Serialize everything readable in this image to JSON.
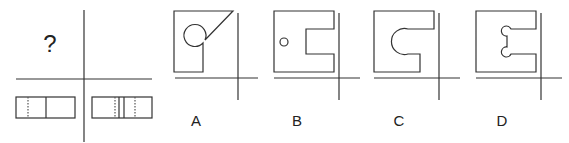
{
  "question": {
    "placeholder_symbol": "?",
    "description": "Three-view drawing; top view unknown. Front view and side view are rectangles with hidden (dashed) and visible lines."
  },
  "views": {
    "front_view": {
      "lines": [
        "dashed",
        "solid"
      ]
    },
    "side_view": {
      "lines": [
        "dashed",
        "solid",
        "solid",
        "dashed"
      ]
    }
  },
  "options": [
    {
      "label": "A",
      "shape": "square with diagonal cut and circular notch"
    },
    {
      "label": "B",
      "shape": "square with rectangular notch and small hole"
    },
    {
      "label": "C",
      "shape": "square with notch ending in semicircle"
    },
    {
      "label": "D",
      "shape": "square with notch having two small round ends"
    }
  ],
  "colors": {
    "stroke": "#333333",
    "background": "#ffffff"
  }
}
